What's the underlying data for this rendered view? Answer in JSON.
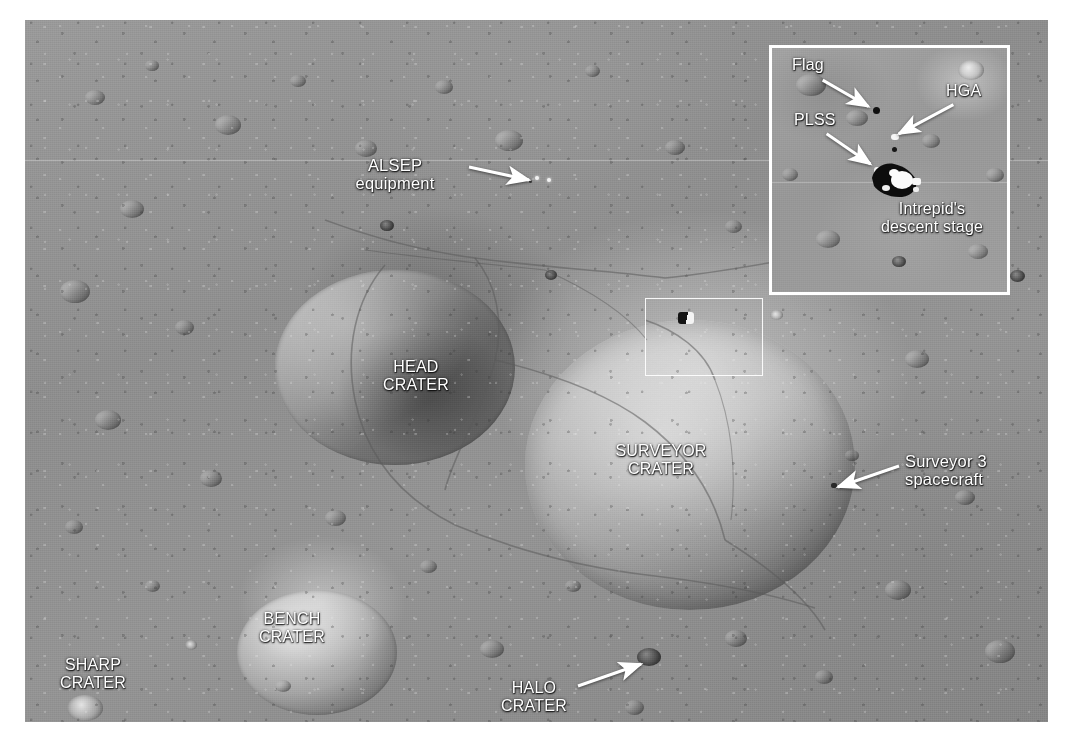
{
  "figure": {
    "kind": "annotated-satellite-photo",
    "background_color": "#ffffff",
    "surface_tone": "#919191",
    "annotation_color": "#ffffff"
  },
  "main_labels": [
    {
      "id": "alsep",
      "text": "ALSEP\nequipment",
      "style": "mixed",
      "x": 384,
      "y": 162,
      "align": "center"
    },
    {
      "id": "head",
      "text": "HEAD\nCRATER",
      "style": "caps",
      "x": 386,
      "y": 356,
      "align": "center"
    },
    {
      "id": "surveyor",
      "text": "SURVEYOR\nCRATER",
      "style": "caps",
      "x": 636,
      "y": 441,
      "align": "center"
    },
    {
      "id": "surveyor3",
      "text": "Surveyor 3\nspacecraft",
      "style": "mixed",
      "x": 905,
      "y": 455,
      "align": "left"
    },
    {
      "id": "bench",
      "text": "BENCH\nCRATER",
      "style": "caps",
      "x": 262,
      "y": 612,
      "align": "center"
    },
    {
      "id": "sharp",
      "text": "SHARP\nCRATER",
      "style": "caps",
      "x": 58,
      "y": 658,
      "align": "center"
    },
    {
      "id": "halo",
      "text": "HALO\nCRATER",
      "style": "caps",
      "x": 504,
      "y": 679,
      "align": "center"
    }
  ],
  "main_arrows": [
    {
      "id": "alsep-arrow",
      "x1": 469,
      "y1": 167,
      "x2": 529,
      "y2": 180
    },
    {
      "id": "surveyor3-arrow",
      "x1": 899,
      "y1": 466,
      "x2": 838,
      "y2": 487
    },
    {
      "id": "halo-arrow",
      "x1": 578,
      "y1": 686,
      "x2": 641,
      "y2": 664
    }
  ],
  "locator_box": {
    "name": "inset-source-region",
    "x": 620,
    "y": 278,
    "width": 118,
    "height": 78
  },
  "inset": {
    "frame": {
      "x": 744,
      "y": 25,
      "width": 241,
      "height": 250,
      "border_color": "#ffffff"
    },
    "labels": [
      {
        "id": "flag",
        "text": "Flag",
        "x": 22,
        "y": 10,
        "align": "left"
      },
      {
        "id": "hga",
        "text": "HGA",
        "x": 176,
        "y": 36,
        "align": "left"
      },
      {
        "id": "plss",
        "text": "PLSS",
        "x": 24,
        "y": 65,
        "align": "left"
      },
      {
        "id": "intrepid",
        "text": "Intrepid's\ndescent stage",
        "x": 130,
        "y": 155,
        "align": "center"
      }
    ],
    "arrows": [
      {
        "id": "flag-arrow",
        "x1": 52,
        "y1": 33,
        "x2": 101,
        "y2": 62
      },
      {
        "id": "hga-arrow",
        "x1": 186,
        "y1": 58,
        "x2": 127,
        "y2": 90
      },
      {
        "id": "plss-arrow",
        "x1": 56,
        "y1": 88,
        "x2": 103,
        "y2": 122
      }
    ]
  },
  "features": {
    "seam_y": 160,
    "descent_stage_present": true,
    "alsep_dots": 2
  }
}
